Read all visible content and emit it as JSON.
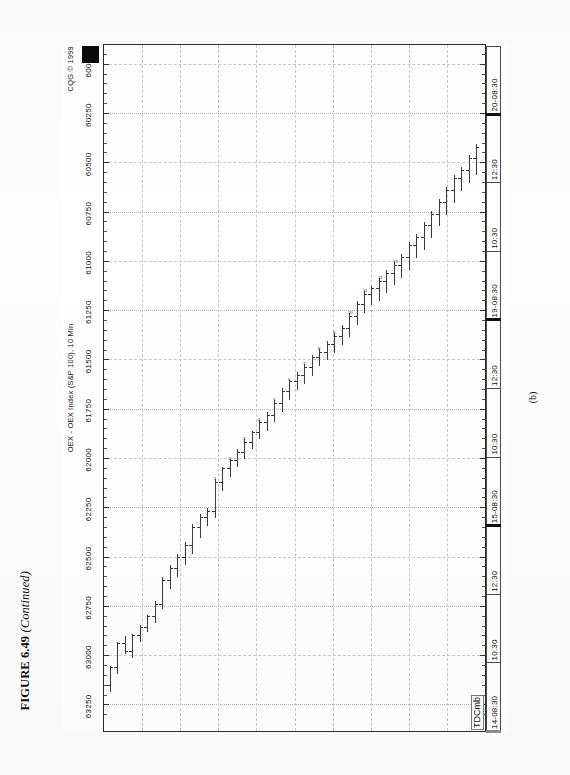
{
  "figure": {
    "number": "FIGURE 6.49",
    "continued": "(Continued)",
    "panel_label": "(b)"
  },
  "chart": {
    "title": "OEX - OEX Index (S&P 100), 10 Min",
    "copyright": "CQG © 1999",
    "study_label": "TDCmb",
    "marker_box": "black-square"
  },
  "chart_data": {
    "type": "ohlc",
    "title": "OEX - OEX Index (S&P 100), 10 Min",
    "xlabel": "",
    "ylabel": "",
    "ylim": [
      59900,
      63380
    ],
    "grid": true,
    "legend": "none",
    "price_ticks": [
      "63250",
      "63000",
      "62750",
      "62500",
      "62250",
      "62000",
      "61750",
      "61500",
      "61250",
      "61000",
      "60750",
      "60500",
      "60250",
      "60000"
    ],
    "price_tick_values": [
      63250,
      63000,
      62750,
      62500,
      62250,
      62000,
      61750,
      61500,
      61250,
      61000,
      60750,
      60500,
      60250,
      60000
    ],
    "price_tick_step": 250,
    "time_ticks": [
      "14-08:30",
      "10:30",
      "12:30",
      "15-08:30",
      "10:30",
      "12:30",
      "19-08:30",
      "10:30",
      "12:30",
      "20-08:30"
    ],
    "sessions": [
      "14",
      "15",
      "19",
      "20"
    ],
    "bar_interval_minutes": 10,
    "bars": [
      {
        "o": 63150,
        "h": 63180,
        "l": 63050,
        "c": 63060,
        "n": ""
      },
      {
        "o": 63060,
        "h": 63090,
        "l": 62930,
        "c": 62940,
        "n": ""
      },
      {
        "o": 62940,
        "h": 62990,
        "l": 62900,
        "c": 62980,
        "n": ""
      },
      {
        "o": 62980,
        "h": 63010,
        "l": 62890,
        "c": 62900,
        "n": ""
      },
      {
        "o": 62900,
        "h": 62930,
        "l": 62840,
        "c": 62860,
        "n": ""
      },
      {
        "o": 62860,
        "h": 62880,
        "l": 62790,
        "c": 62800,
        "n": ""
      },
      {
        "o": 62800,
        "h": 62830,
        "l": 62720,
        "c": 62740,
        "n": ""
      },
      {
        "o": 62740,
        "h": 62760,
        "l": 62600,
        "c": 62620,
        "n": ""
      },
      {
        "o": 62620,
        "h": 62660,
        "l": 62540,
        "c": 62560,
        "n": ""
      },
      {
        "o": 62560,
        "h": 62600,
        "l": 62480,
        "c": 62500,
        "n": ""
      },
      {
        "o": 62500,
        "h": 62540,
        "l": 62420,
        "c": 62440,
        "n": ""
      },
      {
        "o": 62440,
        "h": 62480,
        "l": 62330,
        "c": 62350,
        "n": ""
      },
      {
        "o": 62350,
        "h": 62400,
        "l": 62280,
        "c": 62300,
        "n": ""
      },
      {
        "o": 62300,
        "h": 62340,
        "l": 62250,
        "c": 62270,
        "n": ""
      },
      {
        "o": 62270,
        "h": 62300,
        "l": 62100,
        "c": 62120,
        "n": ""
      },
      {
        "o": 62120,
        "h": 62160,
        "l": 62040,
        "c": 62050,
        "n": ""
      },
      {
        "o": 62050,
        "h": 62090,
        "l": 62000,
        "c": 62010,
        "n": ""
      },
      {
        "o": 62010,
        "h": 62040,
        "l": 61950,
        "c": 61970,
        "n": ""
      },
      {
        "o": 61970,
        "h": 62000,
        "l": 61900,
        "c": 61920,
        "n": ""
      },
      {
        "o": 61920,
        "h": 61950,
        "l": 61860,
        "c": 61870,
        "n": ""
      },
      {
        "o": 61870,
        "h": 61900,
        "l": 61800,
        "c": 61820,
        "n": ""
      },
      {
        "o": 61820,
        "h": 61860,
        "l": 61760,
        "c": 61780,
        "n": ""
      },
      {
        "o": 61780,
        "h": 61810,
        "l": 61700,
        "c": 61720,
        "n": ""
      },
      {
        "o": 61720,
        "h": 61760,
        "l": 61640,
        "c": 61660,
        "n": ""
      },
      {
        "o": 61660,
        "h": 61700,
        "l": 61600,
        "c": 61610,
        "n": ""
      },
      {
        "o": 61610,
        "h": 61650,
        "l": 61560,
        "c": 61580,
        "n": ""
      },
      {
        "o": 61580,
        "h": 61620,
        "l": 61520,
        "c": 61540,
        "n": ""
      },
      {
        "o": 61540,
        "h": 61580,
        "l": 61470,
        "c": 61490,
        "n": ""
      },
      {
        "o": 61490,
        "h": 61530,
        "l": 61440,
        "c": 61460,
        "n": ""
      },
      {
        "o": 61460,
        "h": 61500,
        "l": 61400,
        "c": 61420,
        "n": ""
      },
      {
        "o": 61420,
        "h": 61460,
        "l": 61360,
        "c": 61380,
        "n": ""
      },
      {
        "o": 61380,
        "h": 61420,
        "l": 61320,
        "c": 61340,
        "n": ""
      },
      {
        "o": 61340,
        "h": 61380,
        "l": 61260,
        "c": 61280,
        "n": ""
      },
      {
        "o": 61280,
        "h": 61320,
        "l": 61200,
        "c": 61220,
        "n": ""
      },
      {
        "o": 61220,
        "h": 61260,
        "l": 61150,
        "c": 61170,
        "n": ""
      },
      {
        "o": 61170,
        "h": 61220,
        "l": 61120,
        "c": 61140,
        "n": ""
      },
      {
        "o": 61140,
        "h": 61200,
        "l": 61080,
        "c": 61100,
        "n": ""
      },
      {
        "o": 61100,
        "h": 61160,
        "l": 61040,
        "c": 61060,
        "n": ""
      },
      {
        "o": 61060,
        "h": 61120,
        "l": 61000,
        "c": 61020,
        "n": ""
      },
      {
        "o": 61020,
        "h": 61080,
        "l": 60960,
        "c": 60980,
        "n": ""
      },
      {
        "o": 60980,
        "h": 61040,
        "l": 60900,
        "c": 60920,
        "n": ""
      },
      {
        "o": 60920,
        "h": 60980,
        "l": 60860,
        "c": 60880,
        "n": ""
      },
      {
        "o": 60880,
        "h": 60940,
        "l": 60800,
        "c": 60820,
        "n": ""
      },
      {
        "o": 60820,
        "h": 60880,
        "l": 60740,
        "c": 60760,
        "n": ""
      },
      {
        "o": 60760,
        "h": 60820,
        "l": 60680,
        "c": 60700,
        "n": ""
      },
      {
        "o": 60700,
        "h": 60760,
        "l": 60620,
        "c": 60640,
        "n": ""
      },
      {
        "o": 60640,
        "h": 60700,
        "l": 60560,
        "c": 60580,
        "n": ""
      },
      {
        "o": 60580,
        "h": 60640,
        "l": 60520,
        "c": 60540,
        "n": ""
      },
      {
        "o": 60540,
        "h": 60600,
        "l": 60460,
        "c": 60480,
        "n": ""
      },
      {
        "o": 60480,
        "h": 60560,
        "l": 60400,
        "c": 60420,
        "n": ""
      }
    ],
    "count_annotations": [
      "1",
      "2",
      "3",
      "4",
      "5",
      "6",
      "7",
      "8",
      "9",
      "10",
      "11",
      "12",
      "13"
    ]
  }
}
